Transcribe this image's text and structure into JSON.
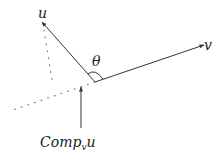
{
  "diagram": {
    "vectors": [
      {
        "name": "u",
        "label": "u"
      },
      {
        "name": "v",
        "label": "v"
      }
    ],
    "angle_label": "θ",
    "component_label": {
      "main": "Comp",
      "subscript": "v",
      "suffix": "u"
    },
    "colors": {
      "line": "#333333",
      "dotted": "#888888"
    }
  }
}
